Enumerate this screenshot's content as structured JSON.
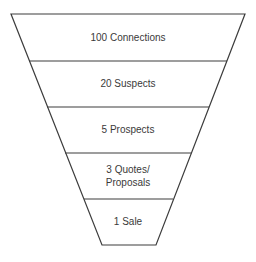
{
  "diagram": {
    "type": "funnel",
    "stroke_color": "#3c3c3c",
    "fill_color": "#ffffff",
    "text_color": "#3a3a3a",
    "stages": [
      {
        "label": "100 Connections",
        "top_y": 14,
        "bottom_y": 61,
        "text_y": 31
      },
      {
        "label": "20 Suspects",
        "top_y": 61,
        "bottom_y": 107,
        "text_y": 77
      },
      {
        "label": "5 Prospects",
        "top_y": 107,
        "bottom_y": 153,
        "text_y": 123
      },
      {
        "label": "3 Quotes/\nProposals",
        "top_y": 153,
        "bottom_y": 199,
        "text_y": 163
      },
      {
        "label": "1 Sale",
        "top_y": 199,
        "bottom_y": 245,
        "text_y": 215
      }
    ]
  }
}
